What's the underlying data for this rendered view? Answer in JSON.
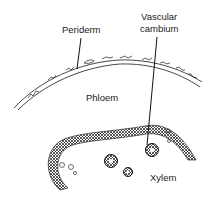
{
  "diagram": {
    "labels": {
      "periderm": "Periderm",
      "vascular_cambium_line1": "Vascular",
      "vascular_cambium_line2": "cambium",
      "phloem": "Phloem",
      "xylem": "Xylem"
    },
    "colors": {
      "ink": "#1a1a1a",
      "background": "#ffffff"
    }
  }
}
